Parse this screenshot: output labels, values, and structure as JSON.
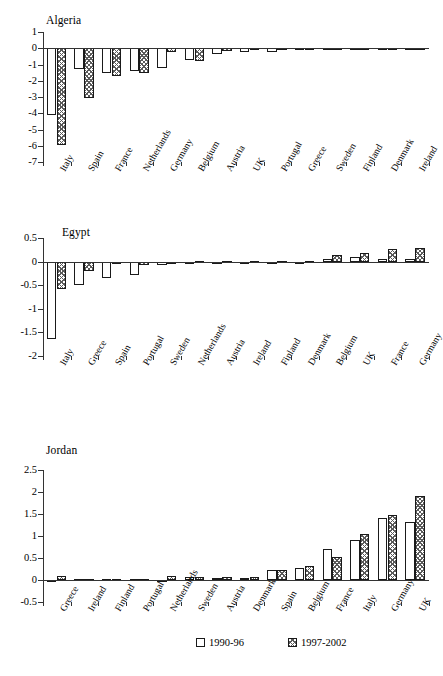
{
  "legend": {
    "position": "bottom",
    "items": [
      {
        "label": "1990-96",
        "pattern": "white-square"
      },
      {
        "label": "1997-2002",
        "pattern": "hatched-square"
      }
    ]
  },
  "chart_data": [
    {
      "type": "bar",
      "title": "Algeria",
      "xlabel": "",
      "ylabel": "",
      "ylim": [
        -7,
        1
      ],
      "yticks": [
        1,
        0,
        -1,
        -2,
        -3,
        -4,
        -5,
        -6,
        -7
      ],
      "ytick_labels": [
        "1",
        "0",
        "-1",
        "-2",
        "-3",
        "-4",
        "-5",
        "-6",
        "-7"
      ],
      "grid": false,
      "categories": [
        "Italy",
        "Spain",
        "France",
        "Netherlands",
        "Germany",
        "Belgium",
        "Austria",
        "UK",
        "Portugal",
        "Greece",
        "Sweden",
        "Finland",
        "Denmark",
        "Ireland"
      ],
      "series": [
        {
          "name": "1990-96",
          "values": [
            -4.1,
            -1.3,
            -1.55,
            -1.38,
            -1.2,
            -0.72,
            -0.38,
            -0.2,
            -0.25,
            -0.03,
            -0.03,
            -0.03,
            -0.03,
            -0.03
          ]
        },
        {
          "name": "1997-2002",
          "values": [
            -5.95,
            -3.07,
            -1.72,
            -1.55,
            -0.2,
            -0.8,
            -0.15,
            -0.03,
            0.04,
            -0.03,
            -0.03,
            -0.03,
            -0.03,
            -0.03
          ]
        }
      ]
    },
    {
      "type": "bar",
      "title": "Egypt",
      "xlabel": "",
      "ylabel": "",
      "ylim": [
        -2,
        0.5
      ],
      "yticks": [
        0.5,
        0,
        -0.5,
        -1,
        -1.5,
        -2
      ],
      "ytick_labels": [
        "0.5",
        "0",
        "-0.5",
        "-1",
        "-1.5",
        "-2"
      ],
      "grid": false,
      "categories": [
        "Italy",
        "Greece",
        "Spain",
        "Portugal",
        "Sweden",
        "Netherlands",
        "Austria",
        "Ireland",
        "Finland",
        "Denmark",
        "Belgium",
        "UK",
        "France",
        "Germany"
      ],
      "series": [
        {
          "name": "1990-96",
          "values": [
            -1.63,
            -0.5,
            -0.35,
            -0.29,
            -0.08,
            -0.01,
            -0.02,
            -0.01,
            -0.01,
            -0.01,
            0.05,
            0.1,
            0.05,
            0.05
          ]
        },
        {
          "name": "1997-2002",
          "values": [
            -0.58,
            -0.2,
            -0.04,
            -0.07,
            -0.05,
            0.01,
            0.02,
            0.01,
            0.01,
            0.02,
            0.13,
            0.18,
            0.27,
            0.29
          ]
        }
      ]
    },
    {
      "type": "bar",
      "title": "Jordan",
      "xlabel": "",
      "ylabel": "",
      "ylim": [
        -0.5,
        2.5
      ],
      "yticks": [
        2.5,
        2,
        1.5,
        1,
        0.5,
        0,
        -0.5
      ],
      "ytick_labels": [
        "2.5",
        "2",
        "1.5",
        "1",
        "0.5",
        "0",
        "-0.5"
      ],
      "grid": false,
      "categories": [
        "Greece",
        "Ireland",
        "Finland",
        "Portugal",
        "Netherlands",
        "Sweden",
        "Austria",
        "Denmark",
        "Spain",
        "Belgium",
        "France",
        "Italy",
        "Germany",
        "UK"
      ],
      "series": [
        {
          "name": "1990-96",
          "values": [
            -0.03,
            0.02,
            0.03,
            0.03,
            0.01,
            0.06,
            0.05,
            0.05,
            0.22,
            0.27,
            0.7,
            0.92,
            1.41,
            1.31
          ]
        },
        {
          "name": "1997-2002",
          "values": [
            0.09,
            0.02,
            0.02,
            0.03,
            0.09,
            0.06,
            0.07,
            0.06,
            0.23,
            0.32,
            0.52,
            1.05,
            1.48,
            1.91
          ]
        }
      ]
    }
  ]
}
